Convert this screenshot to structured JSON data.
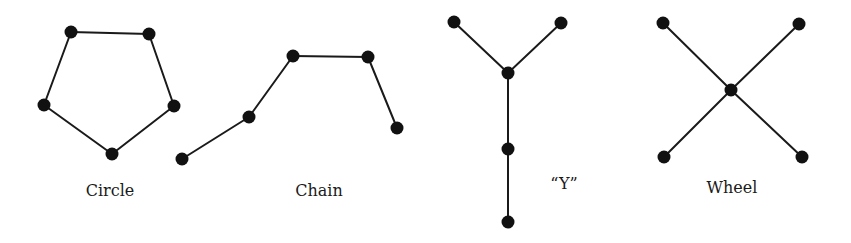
{
  "diagram": {
    "networks": [
      {
        "id": "circle",
        "label": "Circle",
        "label_pos": [
          110,
          196
        ],
        "nodes": [
          [
            71,
            32
          ],
          [
            149,
            34
          ],
          [
            174,
            106
          ],
          [
            112,
            154
          ],
          [
            44,
            105
          ]
        ],
        "edges": [
          [
            0,
            1
          ],
          [
            1,
            2
          ],
          [
            2,
            3
          ],
          [
            3,
            4
          ],
          [
            4,
            0
          ]
        ]
      },
      {
        "id": "chain",
        "label": "Chain",
        "label_pos": [
          319,
          196
        ],
        "nodes": [
          [
            182,
            159
          ],
          [
            249,
            117
          ],
          [
            293,
            56
          ],
          [
            368,
            57
          ],
          [
            397,
            128
          ]
        ],
        "edges": [
          [
            0,
            1
          ],
          [
            1,
            2
          ],
          [
            2,
            3
          ],
          [
            3,
            4
          ]
        ]
      },
      {
        "id": "y",
        "label": "“Y”",
        "label_pos": [
          564,
          189
        ],
        "nodes": [
          [
            454,
            22
          ],
          [
            561,
            23
          ],
          [
            508,
            73
          ],
          [
            508,
            149
          ],
          [
            508,
            222
          ]
        ],
        "edges": [
          [
            0,
            2
          ],
          [
            1,
            2
          ],
          [
            2,
            3
          ],
          [
            3,
            4
          ]
        ]
      },
      {
        "id": "wheel",
        "label": "Wheel",
        "label_pos": [
          732,
          193
        ],
        "nodes": [
          [
            663,
            23
          ],
          [
            799,
            24
          ],
          [
            731,
            90
          ],
          [
            664,
            157
          ],
          [
            802,
            157
          ]
        ],
        "edges": [
          [
            0,
            2
          ],
          [
            1,
            2
          ],
          [
            2,
            3
          ],
          [
            2,
            4
          ]
        ]
      }
    ],
    "style": {
      "node_radius": 6.5,
      "edge_color": "#1a1a1a",
      "node_color": "#111111",
      "background": "#ffffff"
    }
  }
}
